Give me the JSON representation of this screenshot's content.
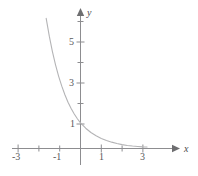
{
  "figure": {
    "background_color": "#ffffff",
    "axis_color": "#8d8d90",
    "curve_color": "#b4b4b6",
    "label_color": "#58585a"
  },
  "axes": {
    "x_name": "x",
    "y_name": "y",
    "x_arrow_icon": "arrow-right-icon",
    "y_arrow_icon": "arrow-up-icon"
  },
  "chart_data": {
    "type": "line",
    "title": "",
    "xlabel": "x",
    "ylabel": "y",
    "xlim": [
      -3.5,
      4.2
    ],
    "ylim": [
      -0.45,
      6.6
    ],
    "grid": false,
    "legend": null,
    "x_ticks": [
      -3,
      -2,
      -1,
      0,
      1,
      2,
      3
    ],
    "x_tick_labels": [
      "-3",
      "",
      "-1",
      "",
      "1",
      "",
      "3"
    ],
    "y_ticks": [
      1,
      2,
      3,
      4,
      5,
      6
    ],
    "y_tick_labels": [
      "1",
      "",
      "3",
      "",
      "5",
      ""
    ],
    "series": [
      {
        "name": "exponential-decay",
        "x": [
          -1.65,
          -1.5,
          -1.35,
          -1.2,
          -1.05,
          -0.9,
          -0.75,
          -0.6,
          -0.45,
          -0.3,
          -0.15,
          0,
          0.25,
          0.5,
          0.75,
          1,
          1.25,
          1.5,
          1.75,
          2,
          2.25,
          2.5,
          2.75,
          3,
          3.2
        ],
        "y": [
          6.35,
          5.48,
          4.73,
          4.08,
          3.52,
          3.04,
          2.62,
          2.26,
          1.95,
          1.68,
          1.45,
          1.25,
          0.99,
          0.78,
          0.62,
          0.49,
          0.39,
          0.31,
          0.24,
          0.19,
          0.15,
          0.12,
          0.1,
          0.08,
          0.07
        ]
      }
    ]
  },
  "labels": {
    "x_neg3": "-3",
    "x_neg1": "-1",
    "x_pos1": "1",
    "x_pos3": "3",
    "y_1": "1",
    "y_3": "3",
    "y_5": "5"
  }
}
